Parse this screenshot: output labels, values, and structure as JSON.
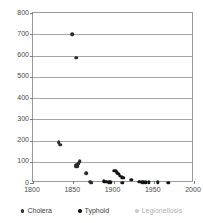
{
  "chart_data": {
    "type": "scatter",
    "title": "",
    "subtitle": "",
    "xlabel": "",
    "ylabel": "",
    "xlim": [
      1800,
      2000
    ],
    "ylim": [
      0,
      800
    ],
    "xticks": [
      "1800",
      "1850",
      "1900",
      "1950",
      "2000"
    ],
    "yticks": [
      "0",
      "100",
      "200",
      "300",
      "400",
      "500",
      "600",
      "700",
      "800"
    ],
    "grid": "horizontal",
    "legend_position": "bottom",
    "series": [
      {
        "name": "Cholera",
        "color": "#2b2b2b",
        "points": [
          {
            "x": 1832,
            "y": 193
          },
          {
            "x": 1834,
            "y": 180
          },
          {
            "x": 1849,
            "y": 700
          },
          {
            "x": 1854,
            "y": 590
          },
          {
            "x": 1853,
            "y": 78
          },
          {
            "x": 1854,
            "y": 84
          },
          {
            "x": 1855,
            "y": 80
          },
          {
            "x": 1856,
            "y": 90
          },
          {
            "x": 1857,
            "y": 95
          },
          {
            "x": 1858,
            "y": 103
          },
          {
            "x": 1866,
            "y": 45
          },
          {
            "x": 1871,
            "y": 6
          },
          {
            "x": 1872,
            "y": 2
          }
        ]
      },
      {
        "name": "Typhoid",
        "color": "#141414",
        "points": [
          {
            "x": 1888,
            "y": 8
          },
          {
            "x": 1890,
            "y": 6
          },
          {
            "x": 1892,
            "y": 5
          },
          {
            "x": 1894,
            "y": 4
          },
          {
            "x": 1896,
            "y": 3
          },
          {
            "x": 1900,
            "y": 56
          },
          {
            "x": 1902,
            "y": 58
          },
          {
            "x": 1904,
            "y": 50
          },
          {
            "x": 1906,
            "y": 42
          },
          {
            "x": 1908,
            "y": 34
          },
          {
            "x": 1910,
            "y": 27
          },
          {
            "x": 1912,
            "y": 24
          },
          {
            "x": 1911,
            "y": 2
          },
          {
            "x": 1922,
            "y": 16
          },
          {
            "x": 1932,
            "y": 5
          },
          {
            "x": 1936,
            "y": 4
          },
          {
            "x": 1938,
            "y": 4
          },
          {
            "x": 1940,
            "y": 4
          },
          {
            "x": 1944,
            "y": 4
          },
          {
            "x": 1955,
            "y": 4
          },
          {
            "x": 1968,
            "y": 2
          }
        ]
      },
      {
        "name": "Legionellosis",
        "color": "#cccccc",
        "points": []
      }
    ]
  },
  "legend": {
    "entries": [
      {
        "label": "Cholera"
      },
      {
        "label": "Typhoid"
      },
      {
        "label": "Legionellosis"
      }
    ]
  }
}
